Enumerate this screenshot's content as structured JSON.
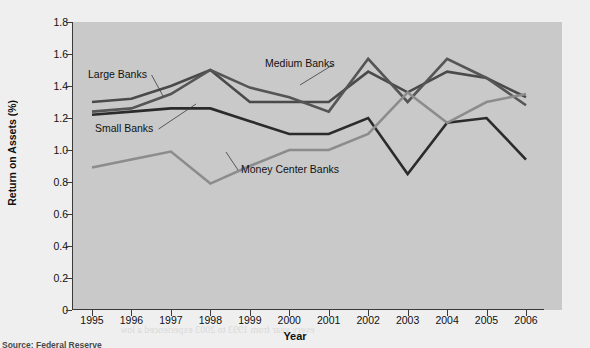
{
  "figure": {
    "source_note": "Source: Federal Reserve",
    "background_color": "#efefef",
    "plot_background_color": "#c9c9c9"
  },
  "ghost_text": [
    {
      "text": "Return on Equity (ROE)",
      "x": 300,
      "y": 172,
      "size": 15,
      "weight": "bold"
    },
    {
      "text": "Return on equity (ROE) measures the return to the bank's owners",
      "x": 300,
      "y": 190,
      "size": 10,
      "weight": "normal"
    },
    {
      "text": "and price ROA, scaled by the bank's debt-to-equity level.",
      "x": 300,
      "y": 201,
      "size": 10,
      "weight": "normal"
    },
    {
      "text": "ROE = ROA × Leverage Measure",
      "x": 330,
      "y": 221,
      "size": 11,
      "weight": "normal"
    },
    {
      "text": "Net Income          Total Assets",
      "x": 330,
      "y": 237,
      "size": 10,
      "weight": "normal"
    },
    {
      "text": "Total Assets        Equity Capital",
      "x": 330,
      "y": 249,
      "size": 10,
      "weight": "normal"
    },
    {
      "text": "Over the 1990s and into the 2000s, both ROA and ROE",
      "x": 170,
      "y": 280,
      "size": 10,
      "weight": "normal"
    },
    {
      "text": "reached new highs in the banking sector",
      "x": 210,
      "y": 292,
      "size": 10,
      "weight": "normal"
    },
    {
      "text": "every year from 1993 to 2003 experienced a low",
      "x": 120,
      "y": 324,
      "size": 10,
      "weight": "normal"
    }
  ],
  "chart_data": {
    "type": "line",
    "title": "",
    "xlabel": "Year",
    "ylabel": "Return on Assets (%)",
    "x": [
      1995,
      1996,
      1997,
      1998,
      1999,
      2000,
      2001,
      2002,
      2003,
      2004,
      2005,
      2006
    ],
    "xlim": [
      1995,
      2006
    ],
    "ylim": [
      0,
      1.8
    ],
    "y_ticks": [
      "1.8",
      "1.6",
      "1.4",
      "1.2",
      "1.0",
      "0.8",
      "0.6",
      "0.4",
      "0.2",
      "0"
    ],
    "y_tick_values": [
      1.8,
      1.6,
      1.4,
      1.2,
      1.0,
      0.8,
      0.6,
      0.4,
      0.2,
      0
    ],
    "x_ticks": [
      "1995",
      "1996",
      "1997",
      "1998",
      "1999",
      "2000",
      "2001",
      "2002",
      "2003",
      "2004",
      "2005",
      "2006"
    ],
    "grid": false,
    "legend": "inline-annotations",
    "series": [
      {
        "name": "Large Banks",
        "color": "#4a4a4a",
        "width": 2.6,
        "values": [
          1.3,
          1.32,
          1.4,
          1.5,
          1.3,
          1.3,
          1.3,
          1.49,
          1.36,
          1.49,
          1.45,
          1.33
        ],
        "label": {
          "text": "Large Banks",
          "x": 88,
          "y": 68,
          "leader_to_x": 163,
          "leader_to_y": 96
        }
      },
      {
        "name": "Medium Banks",
        "color": "#555555",
        "width": 2.6,
        "values": [
          1.24,
          1.26,
          1.35,
          1.5,
          1.39,
          1.33,
          1.24,
          1.57,
          1.3,
          1.57,
          1.45,
          1.28
        ],
        "label": {
          "text": "Medium Banks",
          "x": 265,
          "y": 57,
          "leader_to_x": 300,
          "leader_to_y": 85
        }
      },
      {
        "name": "Small Banks",
        "color": "#2b2b2b",
        "width": 2.6,
        "values": [
          1.22,
          1.24,
          1.26,
          1.26,
          1.18,
          1.1,
          1.1,
          1.2,
          0.85,
          1.17,
          1.2,
          0.94
        ],
        "label": {
          "text": "Small Banks",
          "x": 95,
          "y": 122,
          "leader_to_x": 196,
          "leader_to_y": 104
        }
      },
      {
        "name": "Money Center Banks",
        "color": "#8c8c8c",
        "width": 2.6,
        "values": [
          0.89,
          0.94,
          0.99,
          0.79,
          0.9,
          1.0,
          1.0,
          1.1,
          1.36,
          1.17,
          1.3,
          1.35
        ],
        "label": {
          "text": "Money Center Banks",
          "x": 241,
          "y": 163,
          "leader_to_x": 226,
          "leader_to_y": 152
        }
      }
    ]
  }
}
